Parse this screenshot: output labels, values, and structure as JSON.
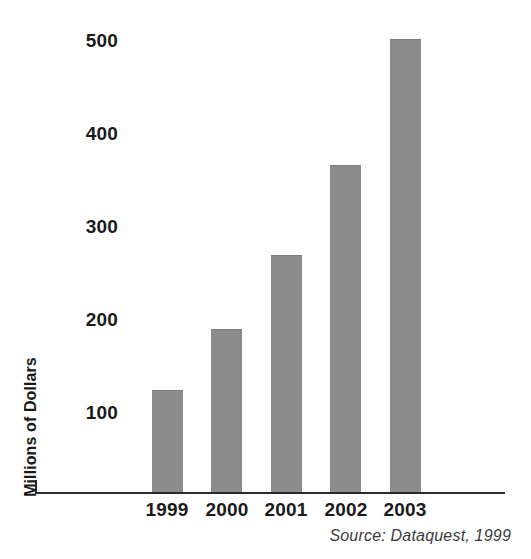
{
  "chart_data": {
    "type": "bar",
    "title": "",
    "subtitle": "",
    "xlabel": "",
    "ylabel": "Millions of Dollars",
    "categories": [
      "1999",
      "2000",
      "2001",
      "2002",
      "2003"
    ],
    "values": [
      110,
      175,
      255,
      352,
      487
    ],
    "series": [
      {
        "name": "Millions of Dollars",
        "values": [
          110,
          175,
          255,
          352,
          487
        ]
      }
    ],
    "ylim": [
      0,
      520
    ],
    "yticks": [
      100,
      200,
      300,
      400,
      500
    ],
    "ytick_labels": [
      "100",
      "200",
      "300",
      "400",
      "500"
    ],
    "grid": false,
    "legend": false,
    "legend_position": "none",
    "bar_color": "#8c8c8c",
    "axis_color": "#2b2b2b",
    "text_color": "#1a1a1a",
    "annotations": [
      {
        "name": "source-note",
        "text": "Source: Dataquest, 1999",
        "position": "bottom-right",
        "style": "italic"
      }
    ]
  },
  "source_note": "Source: Dataquest, 1999"
}
